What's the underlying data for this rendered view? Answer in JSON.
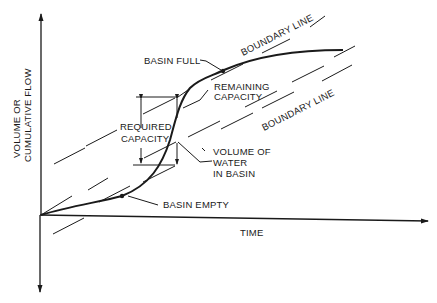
{
  "diagram": {
    "axes": {
      "y_label_line1": "VOLUME OR",
      "y_label_line2": "CUMULATIVE FLOW",
      "x_label": "TIME"
    },
    "labels": {
      "basin_full": "BASIN FULL",
      "basin_empty": "BASIN EMPTY",
      "remaining_capacity_line1": "REMAINING",
      "remaining_capacity_line2": "CAPACITY",
      "required_capacity_line1": "REQUIRED",
      "required_capacity_line2": "CAPACITY",
      "volume_water_line1": "VOLUME OF",
      "volume_water_line2": "WATER",
      "volume_water_line3": "IN BASIN",
      "boundary_line_upper": "BOUNDARY LINE",
      "boundary_line_lower": "BOUNDARY LINE"
    },
    "colors": {
      "ink": "#1a1a1a",
      "background": "#ffffff"
    }
  }
}
